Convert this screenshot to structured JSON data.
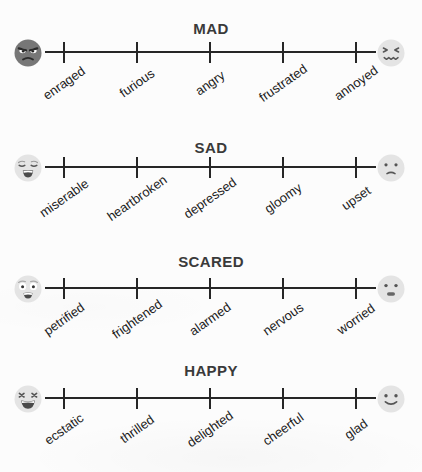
{
  "palette": {
    "background": "#fcfcfc",
    "line": "#262626",
    "title_text": "#3a3a3a",
    "label_text": "#1b1b1b",
    "face_light": "#e4e4e4",
    "face_dark": "#777777",
    "feature": "#4a4a4a"
  },
  "scales": [
    {
      "title": "MAD",
      "left_icon": "enraged-face-icon",
      "right_icon": "annoyed-face-icon",
      "labels": [
        "enraged",
        "furious",
        "angry",
        "frustrated",
        "annoyed"
      ]
    },
    {
      "title": "SAD",
      "left_icon": "weary-crying-face-icon",
      "right_icon": "slightly-frowning-face-icon",
      "labels": [
        "miserable",
        "heartbroken",
        "depressed",
        "gloomy",
        "upset"
      ]
    },
    {
      "title": "SCARED",
      "left_icon": "fearful-face-icon",
      "right_icon": "worried-face-icon",
      "labels": [
        "petrified",
        "frightened",
        "alarmed",
        "nervous",
        "worried"
      ]
    },
    {
      "title": "HAPPY",
      "left_icon": "laughing-face-icon",
      "right_icon": "smiling-face-icon",
      "labels": [
        "ecstatic",
        "thrilled",
        "delighted",
        "cheerful",
        "glad"
      ]
    }
  ]
}
